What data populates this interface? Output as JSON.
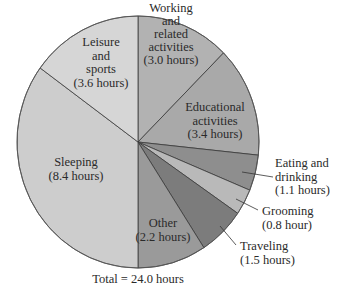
{
  "chart_data": {
    "type": "pie",
    "title": "",
    "total_label": "Total = 24.0 hours",
    "unit": "hours",
    "start_angle_deg": 0,
    "direction": "clockwise",
    "slices": [
      {
        "name": "Working and related activities",
        "label_lines": [
          "Working",
          "and",
          "related",
          "activities",
          "(3.0 hours)"
        ],
        "value": 3.0,
        "color": "#b2b2b2",
        "label_inside": true
      },
      {
        "name": "Educational activities",
        "label_lines": [
          "Educational",
          "activities",
          "(3.4 hours)"
        ],
        "value": 3.4,
        "color": "#a9a9a9",
        "label_inside": true
      },
      {
        "name": "Eating and drinking",
        "label_lines": [
          "Eating and",
          "drinking",
          "(1.1 hours)"
        ],
        "value": 1.1,
        "color": "#8e8e8e",
        "label_inside": false
      },
      {
        "name": "Grooming",
        "label_lines": [
          "Grooming",
          "(0.8 hour)"
        ],
        "value": 0.8,
        "color": "#b9b9b9",
        "label_inside": false
      },
      {
        "name": "Traveling",
        "label_lines": [
          "Traveling",
          "(1.5 hours)"
        ],
        "value": 1.5,
        "color": "#7c7c7c",
        "label_inside": false
      },
      {
        "name": "Other",
        "label_lines": [
          "Other",
          "(2.2 hours)"
        ],
        "value": 2.2,
        "color": "#9a9a9a",
        "label_inside": true
      },
      {
        "name": "Sleeping",
        "label_lines": [
          "Sleeping",
          "(8.4 hours)"
        ],
        "value": 8.4,
        "color": "#cdcdcd",
        "label_inside": true
      },
      {
        "name": "Leisure and sports",
        "label_lines": [
          "Leisure",
          "and",
          "sports",
          "(3.6 hours)"
        ],
        "value": 3.6,
        "color": "#d6d6d6",
        "label_inside": true
      }
    ],
    "categories": [
      "Working and related activities",
      "Educational activities",
      "Eating and drinking",
      "Grooming",
      "Traveling",
      "Other",
      "Sleeping",
      "Leisure and sports"
    ],
    "values": [
      3.0,
      3.4,
      1.1,
      0.8,
      1.5,
      2.2,
      8.4,
      3.6
    ],
    "legend": "none",
    "grid": false
  },
  "layout": {
    "cx": 138,
    "cy": 142,
    "rx": 121,
    "ry": 126,
    "label_positions": [
      {
        "x": 171,
        "y": 12,
        "anchor": "middle",
        "line_h": 13
      },
      {
        "x": 215,
        "y": 111,
        "anchor": "middle",
        "line_h": 13.5
      },
      {
        "x": 275,
        "y": 167,
        "anchor": "start",
        "line_h": 13.5,
        "leader": [
          [
            242,
            172
          ],
          [
            273,
            177
          ]
        ]
      },
      {
        "x": 262,
        "y": 215,
        "anchor": "start",
        "line_h": 13.5,
        "leader": [
          [
            236,
            199
          ],
          [
            258,
            210
          ]
        ]
      },
      {
        "x": 240,
        "y": 250,
        "anchor": "start",
        "line_h": 13.5,
        "leader": [
          [
            220,
            226
          ],
          [
            236,
            245
          ]
        ]
      },
      {
        "x": 163,
        "y": 227,
        "anchor": "middle",
        "line_h": 13.5
      },
      {
        "x": 76,
        "y": 166,
        "anchor": "middle",
        "line_h": 13.5
      },
      {
        "x": 101,
        "y": 46,
        "anchor": "middle",
        "line_h": 13.5
      }
    ],
    "total_pos": {
      "x": 138,
      "y": 283
    }
  }
}
